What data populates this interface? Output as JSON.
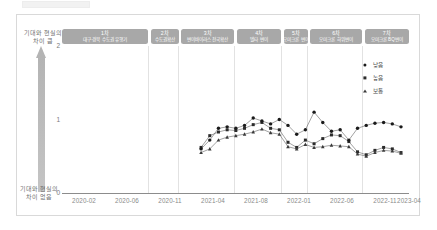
{
  "figure": {
    "y_axis": {
      "ticks": [
        "2",
        "1",
        "0"
      ],
      "caption_top": "기대와 현실의\n차이 큼",
      "caption_top_line1": "기대와 현실의",
      "caption_top_line2": "차이 큼",
      "caption_bottom_line1": "기대와 현실의",
      "caption_bottom_line2": "차이 없음"
    },
    "x_axis": {
      "ticks": [
        "2020-02",
        "2020-06",
        "2020-11",
        "2021-04",
        "2021-08",
        "2022-01",
        "2022-06",
        "2022-11",
        "2023-04"
      ]
    },
    "phases": [
      {
        "num": "1차",
        "name": "대구·경북 수도권 유행기"
      },
      {
        "num": "2차",
        "name": "수도권확산"
      },
      {
        "num": "3차",
        "name": "변이바이러스 전국확산"
      },
      {
        "num": "4차",
        "name": "델타 변이"
      },
      {
        "num": "5차",
        "name": "오미크론 변이"
      },
      {
        "num": "6차",
        "name": "오미크론 하위변이"
      },
      {
        "num": "7차",
        "name": "오미크론 BQ변이"
      }
    ],
    "legend": [
      {
        "label": "낮음",
        "marker": "cross-icon"
      },
      {
        "label": "높음",
        "marker": "square-icon"
      },
      {
        "label": "보통",
        "marker": "triangle-icon"
      }
    ],
    "colors": {
      "phase_box": "#a8a8a8",
      "arrow": "#b4b4b4",
      "gridline": "#e2e2e2",
      "axis": "#8c8c8c",
      "marker": "#1a1a1a"
    }
  },
  "chart_data": {
    "type": "line",
    "title": "",
    "xlabel": "",
    "ylabel": "기대와 현실의 차이",
    "ylim": [
      0,
      2
    ],
    "yticks": [
      0,
      1,
      2
    ],
    "grid": false,
    "legend_position": "top-right",
    "x": [
      "2020-02",
      "2020-03",
      "2020-04",
      "2020-05",
      "2020-06",
      "2020-07",
      "2020-08",
      "2020-09",
      "2020-10",
      "2020-11",
      "2020-12",
      "2021-01",
      "2021-02",
      "2021-03",
      "2021-04",
      "2021-05",
      "2021-06",
      "2021-07",
      "2021-08",
      "2021-09",
      "2021-10",
      "2021-11",
      "2021-12",
      "2022-01",
      "2022-02",
      "2022-03",
      "2022-04",
      "2022-05",
      "2022-06",
      "2022-07",
      "2022-08",
      "2022-09",
      "2022-10",
      "2022-11",
      "2022-12",
      "2023-01",
      "2023-02",
      "2023-03",
      "2023-04",
      "2023-05"
    ],
    "series": [
      {
        "name": "높음",
        "marker": "square",
        "values": [
          null,
          null,
          null,
          null,
          null,
          null,
          null,
          null,
          null,
          null,
          null,
          null,
          null,
          null,
          null,
          null,
          0.62,
          0.78,
          0.83,
          0.86,
          0.85,
          0.88,
          0.93,
          0.96,
          0.88,
          0.86,
          0.69,
          0.62,
          0.72,
          0.67,
          0.74,
          0.79,
          0.78,
          0.7,
          0.56,
          0.52,
          0.58,
          0.62,
          0.6,
          0.55
        ]
      },
      {
        "name": "보통",
        "marker": "triangle",
        "values": [
          null,
          null,
          null,
          null,
          null,
          null,
          null,
          null,
          null,
          null,
          null,
          null,
          null,
          null,
          null,
          null,
          0.55,
          0.6,
          0.72,
          0.76,
          0.78,
          0.8,
          0.83,
          0.87,
          0.82,
          0.8,
          0.63,
          0.6,
          0.66,
          0.62,
          0.63,
          0.65,
          0.64,
          0.63,
          0.53,
          0.5,
          0.55,
          0.58,
          0.57,
          0.54
        ]
      },
      {
        "name": "낮음",
        "marker": "circle",
        "values": [
          null,
          null,
          null,
          null,
          null,
          null,
          null,
          null,
          null,
          null,
          null,
          null,
          null,
          null,
          null,
          null,
          0.6,
          0.72,
          0.88,
          0.9,
          0.88,
          0.92,
          1.02,
          0.98,
          0.94,
          1.0,
          0.92,
          0.8,
          0.86,
          1.1,
          0.96,
          0.84,
          0.86,
          0.72,
          0.88,
          0.92,
          0.95,
          0.96,
          0.94,
          0.9
        ]
      }
    ]
  }
}
